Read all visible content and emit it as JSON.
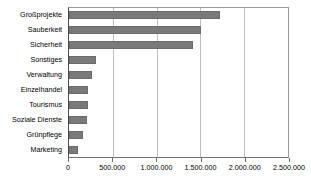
{
  "chart_data": {
    "type": "bar",
    "orientation": "horizontal",
    "title": "",
    "subtitle": "",
    "xlabel": "",
    "ylabel": "",
    "categories": [
      "Großprojekte",
      "Sauberkeit",
      "Sicherheit",
      "Sonstiges",
      "Verwaltung",
      "Einzelhandel",
      "Tourismus",
      "Soziale Dienste",
      "Grünpflege",
      "Marketing"
    ],
    "values": [
      1720000,
      1510000,
      1410000,
      305000,
      260000,
      215000,
      212000,
      210000,
      160000,
      100000
    ],
    "xlim": [
      0,
      2500000
    ],
    "xticks": [
      0,
      500000,
      1000000,
      1500000,
      2000000,
      2500000
    ],
    "xtick_labels": [
      "0",
      "500.000",
      "1.000.000",
      "1.500.000",
      "2.000.000",
      "2.500.000"
    ],
    "grid": true,
    "grid_axis": "x",
    "legend": false,
    "bar_color": "#7a7a7a",
    "bar_edge_color": "#6b6b6b",
    "gridline_color": "#bfbfbf",
    "axis_color": "#6f6f6f",
    "background_color": "#ffffff"
  }
}
